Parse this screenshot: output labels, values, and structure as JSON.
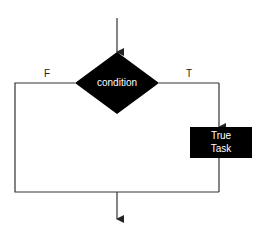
{
  "diagram": {
    "type": "flowchart-if-then",
    "decision": {
      "label": "condition",
      "color": "#000000"
    },
    "branches": {
      "false_label": "F",
      "true_label": "T"
    },
    "task": {
      "line1": "True",
      "line2": "Task",
      "color": "#000000"
    }
  }
}
